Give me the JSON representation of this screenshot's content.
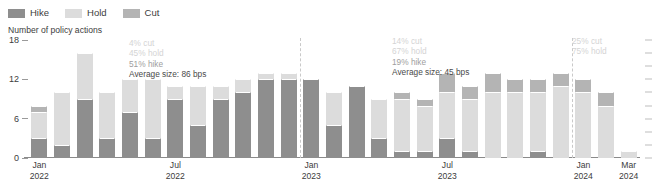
{
  "legend": {
    "items": [
      {
        "label": "Hike",
        "color": "#8e8e8e",
        "icon": "square-swatch-icon"
      },
      {
        "label": "Hold",
        "color": "#dcdcdc",
        "icon": "square-swatch-icon"
      },
      {
        "label": "Cut",
        "color": "#b4b4b4",
        "icon": "square-swatch-icon"
      }
    ]
  },
  "annotations": [
    {
      "id": "annot-2022",
      "lines": [
        {
          "text": "4% cut",
          "tone": "faint"
        },
        {
          "text": "45% hold",
          "tone": "faint"
        },
        {
          "text": "51% hike",
          "tone": "mid"
        },
        {
          "text": "Average size: 86 bps",
          "tone": "dark"
        }
      ],
      "x": 129,
      "y": 38
    },
    {
      "id": "annot-2023",
      "lines": [
        {
          "text": "14% cut",
          "tone": "faint"
        },
        {
          "text": "67% hold",
          "tone": "faint"
        },
        {
          "text": "19% hike",
          "tone": "mid"
        },
        {
          "text": "Average size: 45 bps",
          "tone": "dark"
        }
      ],
      "x": 392,
      "y": 36
    },
    {
      "id": "annot-2024",
      "lines": [
        {
          "text": "25% cut",
          "tone": "faint"
        },
        {
          "text": "75% hold",
          "tone": "faint"
        }
      ],
      "x": 572,
      "y": 36
    }
  ],
  "chart_data": {
    "type": "bar",
    "subtype": "stacked",
    "title": "",
    "ylabel": "Number of policy actions",
    "xlabel": "",
    "ylim": [
      0,
      18
    ],
    "yticks": [
      0,
      6,
      12,
      18
    ],
    "ytick_labels": [
      "0",
      "6",
      "12",
      "18"
    ],
    "grid": false,
    "legend_position": "top-left",
    "x": [
      "Jan 2022",
      "Feb 2022",
      "Mar 2022",
      "Apr 2022",
      "May 2022",
      "Jun 2022",
      "Jul 2022",
      "Aug 2022",
      "Sep 2022",
      "Oct 2022",
      "Nov 2022",
      "Dec 2022",
      "Jan 2023",
      "Feb 2023",
      "Mar 2023",
      "Apr 2023",
      "May 2023",
      "Jun 2023",
      "Jul 2023",
      "Aug 2023",
      "Sep 2023",
      "Oct 2023",
      "Nov 2023",
      "Dec 2023",
      "Jan 2024",
      "Feb 2024",
      "Mar 2024"
    ],
    "xtick_labels": [
      {
        "line1": "Jan",
        "line2": "2022",
        "index": 0
      },
      {
        "line1": "Jul",
        "line2": "2022",
        "index": 6
      },
      {
        "line1": "Jan",
        "line2": "2023",
        "index": 12
      },
      {
        "line1": "Jul",
        "line2": "2023",
        "index": 18
      },
      {
        "line1": "Jan",
        "line2": "2024",
        "index": 24
      },
      {
        "line1": "Mar",
        "line2": "2024",
        "index": 26
      }
    ],
    "separators": [
      12,
      24
    ],
    "series": [
      {
        "name": "Hike",
        "color": "#8e8e8e",
        "values": [
          3,
          2,
          9,
          3,
          7,
          3,
          9,
          5,
          9,
          10,
          12,
          12,
          12,
          5,
          11,
          3,
          1,
          1,
          3,
          1,
          0,
          0,
          1,
          0,
          0,
          0,
          0
        ]
      },
      {
        "name": "Hold",
        "color": "#dcdcdc",
        "values": [
          4,
          8,
          7,
          7,
          5,
          9,
          2,
          6,
          2,
          2,
          1,
          1,
          0,
          5,
          0,
          6,
          8,
          7,
          7,
          8,
          10,
          10,
          9,
          11,
          10,
          8,
          1
        ]
      },
      {
        "name": "Cut",
        "color": "#b4b4b4",
        "values": [
          1,
          0,
          0,
          0,
          0,
          0,
          0,
          0,
          0,
          0,
          0,
          0,
          0,
          0,
          0,
          0,
          1,
          1,
          3,
          2,
          3,
          2,
          2,
          2,
          2,
          2,
          0
        ]
      }
    ]
  }
}
